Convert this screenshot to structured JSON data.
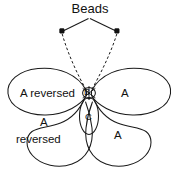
{
  "figure": {
    "kind": "butterfly-loop-knot-diagram",
    "background_color": "#ffffff",
    "ink_color": "#1a1a1a",
    "width": 180,
    "height": 175
  },
  "labels": {
    "beads": "Beads",
    "upper_left_wing": "A reversed",
    "upper_right_wing": "A",
    "lower_left_wing_line1": "A",
    "lower_left_wing_line2": "reversed",
    "lower_right_wing": "A",
    "center_knot": "B",
    "lower_loop": "C"
  },
  "parts": {
    "bead_left": {
      "x": 62,
      "y": 31,
      "shape": "square-dot"
    },
    "bead_right": {
      "x": 117,
      "y": 31,
      "shape": "square-dot"
    },
    "leader_apex": {
      "x": 89,
      "y": 18
    },
    "knot_center": {
      "x": 89,
      "y": 93
    },
    "loop_c_center": {
      "x": 89,
      "y": 116
    }
  },
  "icons": {
    "bead_left": "bead-dot-icon",
    "bead_right": "bead-dot-icon",
    "knot": "knot-icon",
    "loop": "loop-icon"
  }
}
